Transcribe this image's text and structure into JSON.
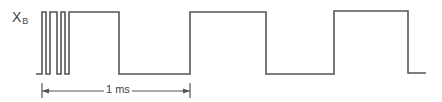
{
  "diagram": {
    "type": "timing-waveform",
    "signal": {
      "name": "X",
      "subscript": "B"
    },
    "levels": {
      "high_y": 12,
      "low_y": 74
    },
    "waveform_points": [
      [
        36,
        74
      ],
      [
        42,
        74
      ],
      [
        42,
        12
      ],
      [
        46,
        12
      ],
      [
        46,
        74
      ],
      [
        50,
        74
      ],
      [
        50,
        12
      ],
      [
        57,
        12
      ],
      [
        57,
        74
      ],
      [
        61,
        74
      ],
      [
        61,
        12
      ],
      [
        65,
        12
      ],
      [
        65,
        74
      ],
      [
        69,
        74
      ],
      [
        69,
        12
      ],
      [
        119,
        12
      ],
      [
        119,
        74
      ],
      [
        190,
        74
      ],
      [
        190,
        12
      ],
      [
        266,
        12
      ],
      [
        266,
        74
      ],
      [
        334,
        74
      ],
      [
        334,
        11
      ],
      [
        408,
        11
      ],
      [
        408,
        73
      ],
      [
        426,
        73
      ]
    ],
    "dimension": {
      "label": "1 ms",
      "x_start": 42,
      "x_end": 190,
      "y": 91
    },
    "colors": {
      "line": "#555555",
      "text": "#444444"
    }
  }
}
